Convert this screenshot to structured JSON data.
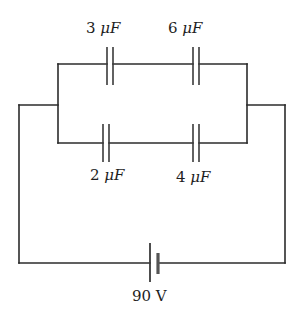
{
  "diagram": {
    "type": "circuit",
    "components": [
      {
        "id": "C1",
        "kind": "capacitor",
        "value": "3",
        "unit": "μF",
        "label": "3 μF",
        "branch": "top",
        "position": "left"
      },
      {
        "id": "C2",
        "kind": "capacitor",
        "value": "6",
        "unit": "μF",
        "label": "6 μF",
        "branch": "top",
        "position": "right"
      },
      {
        "id": "C3",
        "kind": "capacitor",
        "value": "2",
        "unit": "μF",
        "label": "2 μF",
        "branch": "bottom",
        "position": "left"
      },
      {
        "id": "C4",
        "kind": "capacitor",
        "value": "4",
        "unit": "μF",
        "label": "4 μF",
        "branch": "bottom",
        "position": "right"
      },
      {
        "id": "B1",
        "kind": "battery",
        "value": "90",
        "unit": "V",
        "label": "90 V",
        "position": "bottom-center"
      }
    ],
    "topology": "Two branches in parallel (3 μF series 6 μF) || (2 μF series 4 μF), connected across a 90 V battery",
    "labels": {
      "c1_num": "3",
      "c1_unit": "μF",
      "c2_num": "6",
      "c2_unit": "μF",
      "c3_num": "2",
      "c3_unit": "μF",
      "c4_num": "4",
      "c4_unit": "μF",
      "battery": "90 V"
    }
  }
}
